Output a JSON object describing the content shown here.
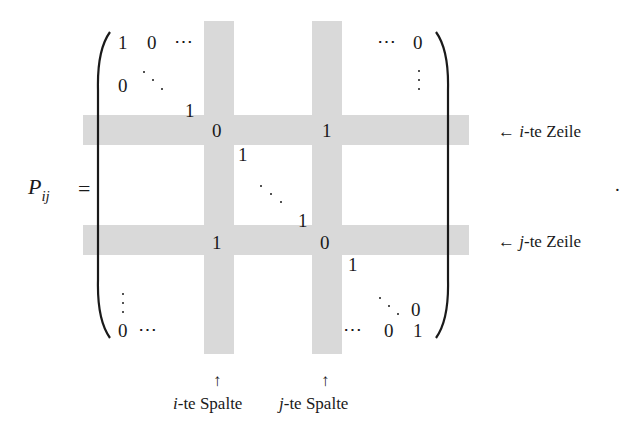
{
  "equation": {
    "lhs": "P",
    "lhs_subscript": "ij",
    "equals": "=",
    "trailing_period": "."
  },
  "matrix": {
    "entries": {
      "r1c1": "1",
      "r1c2": "0",
      "r1_ellipsis_left": "⋯",
      "r1_ellipsis_right": "⋯",
      "r1_last": "0",
      "r2c1": "0",
      "diag_before_i": "1",
      "i_i": "0",
      "i_j": "1",
      "diag_after_i": "1",
      "diag_before_j": "1",
      "j_i": "1",
      "j_j": "0",
      "diag_after_j": "1",
      "second_last_last": "0",
      "last_first": "0",
      "last_ellipsis_left": "⋯",
      "last_ellipsis_right": "⋯",
      "last_second_last": "0",
      "last_last": "1"
    },
    "highlight_color": "#d9d9d9"
  },
  "annotations": {
    "row_i": {
      "arrow": "←",
      "var": "i",
      "suffix": "-te Zeile"
    },
    "row_j": {
      "arrow": "←",
      "var": "j",
      "suffix": "-te Zeile"
    },
    "col_i": {
      "arrow": "↑",
      "var": "i",
      "suffix": "-te Spalte"
    },
    "col_j": {
      "arrow": "↑",
      "var": "j",
      "suffix": "-te Spalte"
    }
  }
}
